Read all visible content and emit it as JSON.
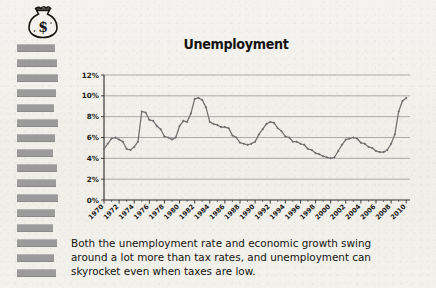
{
  "page": {
    "background_color": "#f3f2ee",
    "ink_color": "#1d1b18"
  },
  "sidebar": {
    "icon_name": "money-bag-icon",
    "redacted_bars": [
      {
        "top": 44,
        "width": 38
      },
      {
        "top": 59,
        "width": 40
      },
      {
        "top": 74,
        "width": 41
      },
      {
        "top": 89,
        "width": 39
      },
      {
        "top": 104,
        "width": 37
      },
      {
        "top": 119,
        "width": 41
      },
      {
        "top": 134,
        "width": 38
      },
      {
        "top": 149,
        "width": 36
      },
      {
        "top": 164,
        "width": 40
      },
      {
        "top": 179,
        "width": 39
      },
      {
        "top": 194,
        "width": 41
      },
      {
        "top": 209,
        "width": 38
      },
      {
        "top": 224,
        "width": 36
      },
      {
        "top": 239,
        "width": 40
      },
      {
        "top": 254,
        "width": 37
      },
      {
        "top": 269,
        "width": 39
      }
    ]
  },
  "caption": {
    "line1": "Both the unemployment rate and economic growth swing",
    "line2": "around a lot more than tax rates, and unemployment can",
    "line3": "skyrocket even when taxes are low."
  },
  "chart_data": {
    "type": "line",
    "title": "Unemployment",
    "xlabel": "",
    "ylabel": "",
    "ylim": [
      0,
      12
    ],
    "yticks": [
      0,
      2,
      4,
      6,
      8,
      10,
      12
    ],
    "ytick_labels": [
      "0%",
      "2%",
      "4%",
      "6%",
      "8%",
      "10%",
      "12%"
    ],
    "xlim": [
      1970,
      2010.5
    ],
    "grid": "horizontal",
    "legend": "none",
    "line_color": "#6f6f6f",
    "marker": "diamond",
    "xtick_labels": [
      "1970",
      "1972",
      "1974",
      "1976",
      "1978",
      "1980",
      "1982",
      "1984",
      "1986",
      "1988",
      "1990",
      "1992",
      "1994",
      "1996",
      "1998",
      "2000",
      "2002",
      "2004",
      "2006",
      "2008",
      "2010"
    ],
    "minor_tick_interval": 0.5,
    "series": [
      {
        "name": "Unemployment rate",
        "x": [
          1970,
          1970.5,
          1971,
          1971.5,
          1972,
          1972.5,
          1973,
          1973.5,
          1974,
          1974.5,
          1975,
          1975.5,
          1976,
          1976.5,
          1977,
          1977.5,
          1978,
          1978.5,
          1979,
          1979.5,
          1980,
          1980.5,
          1981,
          1981.5,
          1982,
          1982.5,
          1983,
          1983.5,
          1984,
          1984.5,
          1985,
          1985.5,
          1986,
          1986.5,
          1987,
          1987.5,
          1988,
          1988.5,
          1989,
          1989.5,
          1990,
          1990.5,
          1991,
          1991.5,
          1992,
          1992.5,
          1993,
          1993.5,
          1994,
          1994.5,
          1995,
          1995.5,
          1996,
          1996.5,
          1997,
          1997.5,
          1998,
          1998.5,
          1999,
          1999.5,
          2000,
          2000.5,
          2001,
          2001.5,
          2002,
          2002.5,
          2003,
          2003.5,
          2004,
          2004.5,
          2005,
          2005.5,
          2006,
          2006.5,
          2007,
          2007.5,
          2008,
          2008.5,
          2009,
          2009.5,
          2010
        ],
        "values": [
          4.9,
          5.4,
          5.9,
          6.0,
          5.8,
          5.6,
          4.9,
          4.8,
          5.1,
          5.6,
          8.5,
          8.4,
          7.7,
          7.6,
          7.1,
          6.8,
          6.1,
          6.0,
          5.8,
          6.0,
          7.1,
          7.6,
          7.5,
          8.3,
          9.7,
          9.8,
          9.6,
          8.9,
          7.5,
          7.3,
          7.2,
          7.0,
          7.0,
          6.9,
          6.2,
          6.0,
          5.5,
          5.4,
          5.3,
          5.4,
          5.6,
          6.3,
          6.8,
          7.3,
          7.5,
          7.4,
          6.9,
          6.6,
          6.1,
          6.0,
          5.6,
          5.6,
          5.4,
          5.3,
          4.9,
          4.8,
          4.5,
          4.4,
          4.2,
          4.1,
          4.0,
          4.1,
          4.7,
          5.3,
          5.8,
          5.9,
          6.0,
          5.9,
          5.5,
          5.4,
          5.1,
          5.0,
          4.7,
          4.6,
          4.6,
          4.8,
          5.4,
          6.3,
          8.5,
          9.5,
          9.8
        ]
      }
    ]
  }
}
